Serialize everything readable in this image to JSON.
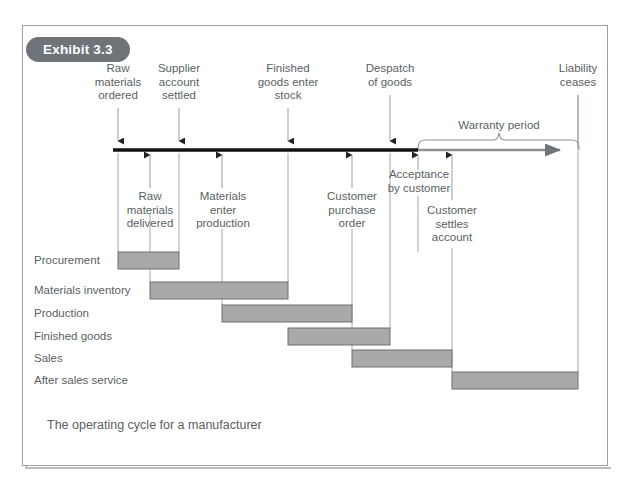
{
  "exhibit": {
    "badge_label": "Exhibit 3.3",
    "caption": "The operating cycle for a manufacturer"
  },
  "colors": {
    "frame_border": "#9aa0a3",
    "badge_bg": "#6e7478",
    "badge_text": "#ffffff",
    "text": "#5a5f63",
    "axis": "#111111",
    "bar_fill": "#a9a9a9",
    "bar_stroke": "#6f6f6f",
    "tick_line": "#9aa0a3"
  },
  "timeline": {
    "axis_label": "operating-cycle-timeline",
    "warranty_label": "Warranty period",
    "events_above": [
      {
        "id": "raw-materials-ordered",
        "label": "Raw\nmaterials\nordered",
        "x": 118
      },
      {
        "id": "supplier-account-settled",
        "label": "Supplier\naccount\nsettled",
        "x": 179
      },
      {
        "id": "finished-goods-enter-stock",
        "label": "Finished\ngoods enter\nstock",
        "x": 288
      },
      {
        "id": "despatch-of-goods",
        "label": "Despatch\nof goods",
        "x": 390
      },
      {
        "id": "liability-ceases",
        "label": "Liability\nceases",
        "x": 578
      }
    ],
    "events_below": [
      {
        "id": "raw-materials-delivered",
        "label": "Raw\nmaterials\ndelivered",
        "x": 150
      },
      {
        "id": "materials-enter-production",
        "label": "Materials\nenter\nproduction",
        "x": 222
      },
      {
        "id": "customer-purchase-order",
        "label": "Customer\npurchase\norder",
        "x": 352
      },
      {
        "id": "acceptance-by-customer",
        "label": "Acceptance\nby customer",
        "x": 418
      },
      {
        "id": "customer-settles-account",
        "label": "Customer\nsettles\naccount",
        "x": 452
      }
    ]
  },
  "chart_data": {
    "type": "bar",
    "title": "The operating cycle for a manufacturer",
    "xlabel": "",
    "ylabel": "",
    "categories": [
      "Procurement",
      "Materials inventory",
      "Production",
      "Finished goods",
      "Sales",
      "After sales service"
    ],
    "bars": [
      {
        "name": "Procurement",
        "start_event": "raw-materials-ordered",
        "end_event": "supplier-account-settled",
        "x_start": 118,
        "x_end": 179,
        "row_y": 252
      },
      {
        "name": "Materials inventory",
        "start_event": "raw-materials-delivered",
        "end_event": "materials-enter-production",
        "x_start": 150,
        "x_end": 288,
        "row_y": 282
      },
      {
        "name": "Production",
        "start_event": "materials-enter-production",
        "end_event": "finished-goods-enter-stock",
        "x_start": 222,
        "x_end": 352,
        "row_y": 305
      },
      {
        "name": "Finished goods",
        "start_event": "finished-goods-enter-stock",
        "end_event": "despatch-of-goods",
        "x_start": 288,
        "x_end": 390,
        "row_y": 328
      },
      {
        "name": "Sales",
        "start_event": "customer-purchase-order",
        "end_event": "customer-settles-account",
        "x_start": 352,
        "x_end": 452,
        "row_y": 350
      },
      {
        "name": "After sales service",
        "start_event": "acceptance-by-customer",
        "end_event": "liability-ceases",
        "x_start": 452,
        "x_end": 578,
        "row_y": 372
      }
    ],
    "legend_position": "none",
    "grid": false
  }
}
